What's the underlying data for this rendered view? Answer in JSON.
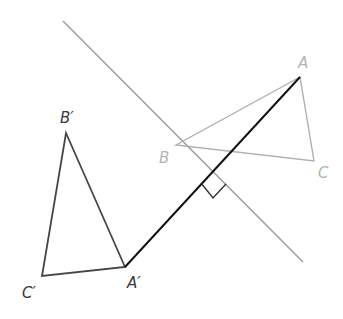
{
  "diagram": {
    "type": "geometric-reflection",
    "colors": {
      "background": "#ffffff",
      "reflection_line": "#a0a0a0",
      "original_triangle": "#b0b0b0",
      "image_triangle": "#454545",
      "segment_AA_prime": "#111111",
      "right_angle_marker": "#333333"
    },
    "reflection_line": {
      "name": "line of reflection",
      "x1": 63,
      "y1": 21,
      "x2": 303,
      "y2": 262
    },
    "original_triangle": {
      "vertices": [
        {
          "id": "A",
          "label": "A",
          "x": 300,
          "y": 77,
          "label_x": 298,
          "label_y": 68
        },
        {
          "id": "B",
          "label": "B",
          "x": 176,
          "y": 145,
          "label_x": 159,
          "label_y": 163
        },
        {
          "id": "C",
          "label": "C",
          "x": 314,
          "y": 161,
          "label_x": 318,
          "label_y": 178
        }
      ]
    },
    "image_triangle": {
      "vertices": [
        {
          "id": "A_prime",
          "label": "A′",
          "x": 125,
          "y": 267,
          "label_x": 127,
          "label_y": 288
        },
        {
          "id": "B_prime",
          "label": "B′",
          "x": 66,
          "y": 133,
          "label_x": 60,
          "label_y": 123
        },
        {
          "id": "C_prime",
          "label": "C′",
          "x": 42,
          "y": 276,
          "label_x": 22,
          "label_y": 298
        }
      ]
    },
    "segment": {
      "name": "AA′",
      "x1": 300,
      "y1": 77,
      "x2": 125,
      "y2": 267
    },
    "right_angle_marker": {
      "points": "201,183 213,198 226,184",
      "intersection": {
        "x": 213,
        "y": 170
      }
    }
  }
}
